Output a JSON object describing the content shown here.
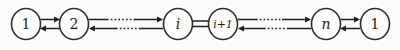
{
  "diagram": {
    "type": "chain-graph",
    "title": "",
    "background_color": "#fbfbfa",
    "stroke_color": "#1d1d1d",
    "node_fill_color": "#fdfdfc",
    "nodes": [
      {
        "id": "n1",
        "label": "1",
        "style": "numeric",
        "cx": 26,
        "cy": 24,
        "rx": 14.5,
        "ry": 15.5
      },
      {
        "id": "n2",
        "label": "2",
        "style": "numeric",
        "cx": 74,
        "cy": 24,
        "rx": 14.5,
        "ry": 15.5
      },
      {
        "id": "ni",
        "label": "i",
        "style": "italic",
        "cx": 178,
        "cy": 24,
        "rx": 14.5,
        "ry": 15.5
      },
      {
        "id": "nip1",
        "label": "i+1",
        "style": "italic-small",
        "cx": 223,
        "cy": 24,
        "rx": 14.5,
        "ry": 15.5
      },
      {
        "id": "nn",
        "label": "n",
        "style": "italic",
        "cx": 326,
        "cy": 24,
        "rx": 14.5,
        "ry": 15.5
      },
      {
        "id": "n1b",
        "label": "1",
        "style": "numeric",
        "cx": 375,
        "cy": 24,
        "rx": 14.5,
        "ry": 15.5
      }
    ],
    "edges": [
      {
        "id": "e1-2-fwd",
        "from": "n1",
        "to": "n2",
        "direction": "right",
        "line": "solid",
        "row": "top"
      },
      {
        "id": "e2-1-bwd",
        "from": "n2",
        "to": "n1",
        "direction": "left",
        "line": "solid",
        "row": "bottom"
      },
      {
        "id": "e2-i-fwd",
        "from": "n2",
        "to": "ni",
        "direction": "right",
        "line": "solid-dotted",
        "row": "top"
      },
      {
        "id": "ei-2-bwd",
        "from": "ni",
        "to": "n2",
        "direction": "left",
        "line": "solid-dotted",
        "row": "bottom"
      },
      {
        "id": "ei-ip1",
        "from": "ni",
        "to": "nip1",
        "direction": "none",
        "line": "double",
        "row": "both"
      },
      {
        "id": "eip1-n-fwd",
        "from": "nip1",
        "to": "nn",
        "direction": "right",
        "line": "solid-dotted",
        "row": "top"
      },
      {
        "id": "en-ip1-bwd",
        "from": "nn",
        "to": "nip1",
        "direction": "left",
        "line": "solid-dotted",
        "row": "bottom"
      },
      {
        "id": "en-1-fwd",
        "from": "nn",
        "to": "n1b",
        "direction": "right",
        "line": "solid",
        "row": "top"
      },
      {
        "id": "e1-n-bwd",
        "from": "n1b",
        "to": "nn",
        "direction": "left",
        "line": "solid",
        "row": "bottom"
      }
    ],
    "labels": {
      "node_1_first": "1",
      "node_2": "2",
      "node_i": "i",
      "node_i_plus_1": "i+1",
      "node_n": "n",
      "node_1_last": "1"
    }
  }
}
